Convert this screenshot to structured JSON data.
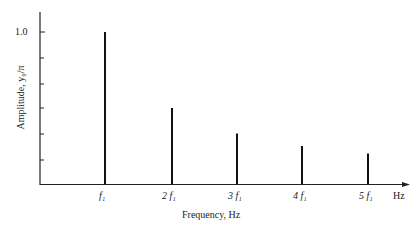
{
  "chart_data": {
    "type": "bar",
    "title": "",
    "xlabel": "Frequency, Hz",
    "ylabel": "Amplitude, y0/π",
    "x_unit_label": "Hz",
    "categories": [
      "f1",
      "2f1",
      "3f1",
      "4f1",
      "5f1"
    ],
    "values": [
      1.0,
      0.5,
      0.333,
      0.25,
      0.2
    ],
    "yticks": [
      1.0
    ],
    "ylim": [
      0,
      1.2
    ],
    "grid": false,
    "legend": null
  },
  "labels": {
    "y_tick_top": "1.0",
    "x_ticks": [
      "f₁",
      "2 f₁",
      "3 f₁",
      "4 f₁",
      "5 f₁"
    ],
    "x_unit": "Hz",
    "x_axis_title": "Frequency, Hz",
    "y_axis_title": "Amplitude, y₀/π"
  }
}
